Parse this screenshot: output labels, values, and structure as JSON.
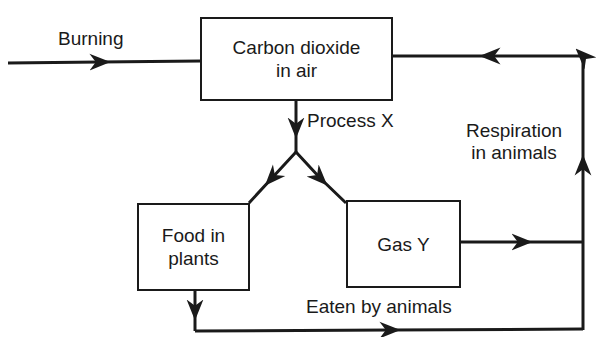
{
  "diagram": {
    "nodes": {
      "co2": {
        "line1": "Carbon dioxide",
        "line2": "in air"
      },
      "food": {
        "line1": "Food in",
        "line2": "plants"
      },
      "gas": {
        "label": "Gas Y"
      }
    },
    "edges": {
      "burning": "Burning",
      "process_x": "Process X",
      "respiration_line1": "Respiration",
      "respiration_line2": "in animals",
      "eaten": "Eaten by animals"
    },
    "colors": {
      "stroke": "#1a1a1a",
      "background": "#ffffff"
    }
  }
}
